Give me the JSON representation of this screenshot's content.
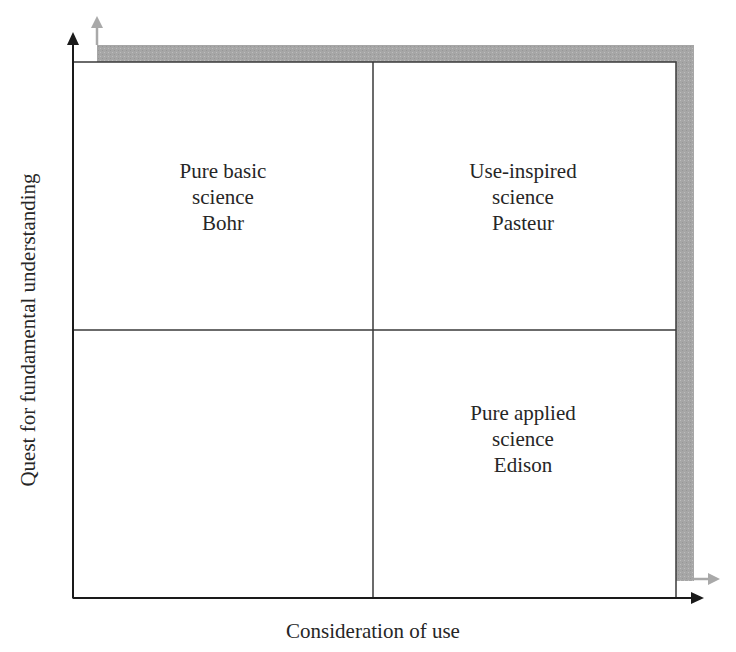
{
  "diagram": {
    "type": "quadrant",
    "x_axis": {
      "label": "Consideration of use",
      "direction": "left-to-right"
    },
    "y_axis": {
      "label": "Quest for fundamental understanding",
      "direction": "bottom-to-top"
    },
    "quadrants": [
      {
        "position": "top-left",
        "lines": [
          "Pure basic",
          "science",
          "Bohr"
        ]
      },
      {
        "position": "top-right",
        "lines": [
          "Use-inspired",
          "science",
          "Pasteur"
        ]
      },
      {
        "position": "bottom-left",
        "lines": []
      },
      {
        "position": "bottom-right",
        "lines": [
          "Pure applied",
          "science",
          "Edison"
        ]
      }
    ],
    "colors": {
      "axis": "#1a1a1a",
      "grid_line": "#3a3a3a",
      "shadow": "#a9a9a9",
      "shadow_arrow": "#a9a9a9",
      "text": "#262626",
      "background": "#ffffff"
    }
  }
}
